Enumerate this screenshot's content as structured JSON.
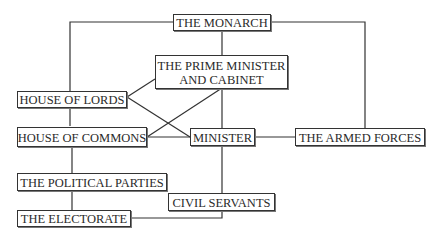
{
  "diagram": {
    "nodes": {
      "monarch": "THE MONARCH",
      "prime_minister_line1": "THE PRIME MINISTER",
      "prime_minister_line2": "AND CABINET",
      "house_of_lords": "HOUSE OF LORDS",
      "house_of_commons": "HOUSE OF COMMONS",
      "minister": "MINISTER",
      "armed_forces": "THE ARMED FORCES",
      "political_parties": "THE POLITICAL PARTIES",
      "civil_servants": "CIVIL SERVANTS",
      "electorate": "THE ELECTORATE"
    },
    "edges": [
      [
        "monarch",
        "house_of_lords"
      ],
      [
        "monarch",
        "armed_forces"
      ],
      [
        "monarch",
        "prime_minister"
      ],
      [
        "prime_minister",
        "minister"
      ],
      [
        "house_of_lords",
        "house_of_commons"
      ],
      [
        "house_of_lords",
        "prime_minister"
      ],
      [
        "house_of_lords",
        "minister"
      ],
      [
        "house_of_commons",
        "prime_minister"
      ],
      [
        "house_of_commons",
        "minister"
      ],
      [
        "minister",
        "armed_forces"
      ],
      [
        "house_of_commons",
        "political_parties"
      ],
      [
        "political_parties",
        "electorate"
      ],
      [
        "minister",
        "civil_servants"
      ],
      [
        "civil_servants",
        "electorate"
      ]
    ]
  }
}
